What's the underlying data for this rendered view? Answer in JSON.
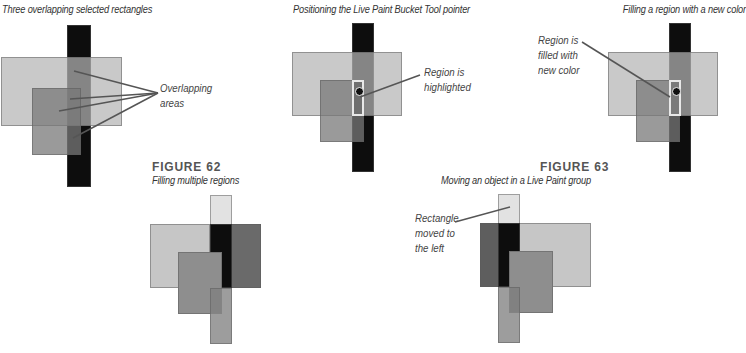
{
  "panels": [
    {
      "caption": "Three overlapping selected rectangles",
      "callout": "Overlapping\nareas"
    },
    {
      "caption": "Positioning the Live Paint Bucket Tool pointer",
      "callout": "Region is\nhighlighted"
    },
    {
      "caption": "Filling a region with a new color",
      "callout": "Region is\nfilled with\nnew color"
    }
  ],
  "figure62": {
    "label": "FIGURE 62",
    "caption": "Filling multiple regions"
  },
  "figure63": {
    "label": "FIGURE 63",
    "caption": "Moving an object in a Live Paint group",
    "callout": "Rectangle\nmoved to\nthe left"
  },
  "colors": {
    "black": "#0d0d0d",
    "light": "#c6c6c6",
    "mid": "#8e8e8e",
    "dark": "#5e5e5e",
    "overlap": "#7a7a7a",
    "highlight": "#e8e8e8"
  }
}
